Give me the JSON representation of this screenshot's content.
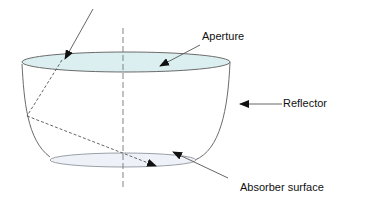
{
  "diagram": {
    "type": "compound parabolic concentrator cross-section",
    "labels": {
      "aperture": "Aperture",
      "reflector": "Reflector",
      "absorber": "Absorber surface"
    },
    "colors": {
      "outline": "#6b6b6b",
      "aperture_fill": "#dbeff0",
      "absorber_fill": "#eef2f8",
      "arrow": "#111111",
      "ray": "#555555",
      "axis": "#777777"
    },
    "elements": [
      {
        "id": "incoming-ray",
        "style": "solid",
        "description": "Incident light ray entering aperture"
      },
      {
        "id": "reflected-ray-1",
        "style": "dashed",
        "description": "Ray from aperture to reflector wall"
      },
      {
        "id": "reflected-ray-2",
        "style": "dashed",
        "description": "Ray reflected from wall onto absorber"
      },
      {
        "id": "optical-axis",
        "style": "dash-dot",
        "description": "Vertical center axis"
      },
      {
        "id": "aperture",
        "shape": "ellipse",
        "position": "top"
      },
      {
        "id": "absorber",
        "shape": "ellipse",
        "position": "bottom"
      },
      {
        "id": "reflector",
        "shape": "curved wall",
        "position": "sides"
      }
    ]
  }
}
